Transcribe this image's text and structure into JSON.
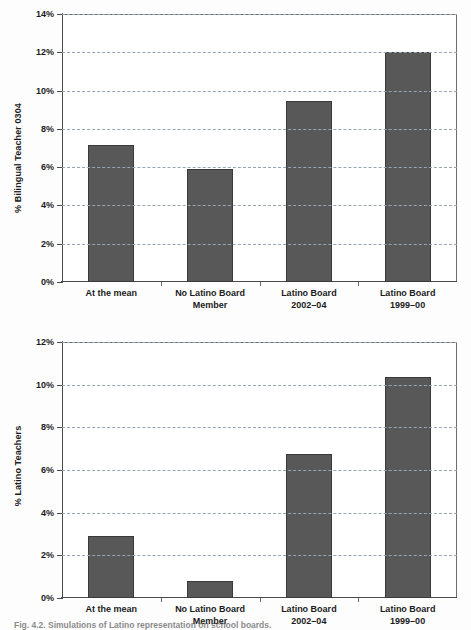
{
  "chart_data": [
    {
      "type": "bar",
      "id": "bilingual-teacher",
      "title": "",
      "xlabel": "",
      "ylabel": "% Bilingual Teacher 0304",
      "ylim": [
        0,
        14
      ],
      "ytick_step": 2,
      "ytick_labels": [
        "0%",
        "2%",
        "4%",
        "6%",
        "8%",
        "10%",
        "12%",
        "14%"
      ],
      "ytick_values": [
        0,
        2,
        4,
        6,
        8,
        10,
        12,
        14
      ],
      "grid": true,
      "grid_style": "dashed-horizontal",
      "legend": "none",
      "categories": [
        {
          "line1": "At the mean",
          "line2": ""
        },
        {
          "line1": "No Latino Board",
          "line2": "Member"
        },
        {
          "line1": "Latino Board",
          "line2": "2002–04"
        },
        {
          "line1": "Latino Board",
          "line2": "1999–00"
        }
      ],
      "values": [
        7.15,
        5.9,
        9.45,
        12.0
      ]
    },
    {
      "type": "bar",
      "id": "latino-teachers",
      "title": "",
      "xlabel": "",
      "ylabel": "% Latino Teachers",
      "ylim": [
        0,
        12
      ],
      "ytick_step": 2,
      "ytick_labels": [
        "0%",
        "2%",
        "4%",
        "6%",
        "8%",
        "10%",
        "12%"
      ],
      "ytick_values": [
        0,
        2,
        4,
        6,
        8,
        10,
        12
      ],
      "grid": true,
      "grid_style": "dashed-horizontal",
      "legend": "none",
      "categories": [
        {
          "line1": "At the mean",
          "line2": ""
        },
        {
          "line1": "No Latino Board",
          "line2": "Member"
        },
        {
          "line1": "Latino Board",
          "line2": "2002–04"
        },
        {
          "line1": "Latino Board",
          "line2": "1999–00"
        }
      ],
      "values": [
        2.9,
        0.8,
        6.75,
        10.35
      ]
    }
  ],
  "colors": {
    "bar_fill": "#585858",
    "bar_stroke": "#3a3a3a",
    "gridline": "#9aa4ae",
    "axis": "#4a4a4a",
    "text": "#1b1b1b",
    "background": "#ffffff"
  },
  "caption": {
    "text": "Fig. 4.2.  Simulations of Latino representation on school boards."
  }
}
